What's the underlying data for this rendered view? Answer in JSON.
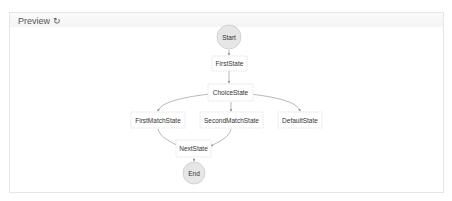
{
  "panel": {
    "title": "Preview",
    "refresh_icon": "refresh-icon"
  },
  "diagram": {
    "nodes": [
      {
        "id": "start",
        "label": "Start",
        "type": "terminal"
      },
      {
        "id": "first",
        "label": "FirstState",
        "type": "state"
      },
      {
        "id": "choice",
        "label": "ChoiceState",
        "type": "state"
      },
      {
        "id": "firstmatch",
        "label": "FirstMatchState",
        "type": "state"
      },
      {
        "id": "secondmatch",
        "label": "SecondMatchState",
        "type": "state"
      },
      {
        "id": "default",
        "label": "DefaultState",
        "type": "state"
      },
      {
        "id": "next",
        "label": "NextState",
        "type": "state"
      },
      {
        "id": "end",
        "label": "End",
        "type": "terminal"
      }
    ],
    "edges": [
      [
        "start",
        "first"
      ],
      [
        "first",
        "choice"
      ],
      [
        "choice",
        "firstmatch"
      ],
      [
        "choice",
        "secondmatch"
      ],
      [
        "choice",
        "default"
      ],
      [
        "firstmatch",
        "next"
      ],
      [
        "secondmatch",
        "next"
      ],
      [
        "next",
        "end"
      ]
    ],
    "colors": {
      "terminal_fill": "#e6e6e6",
      "terminal_stroke": "#cccccc",
      "state_stroke": "#d8d8d8",
      "edge": "#999999"
    }
  }
}
